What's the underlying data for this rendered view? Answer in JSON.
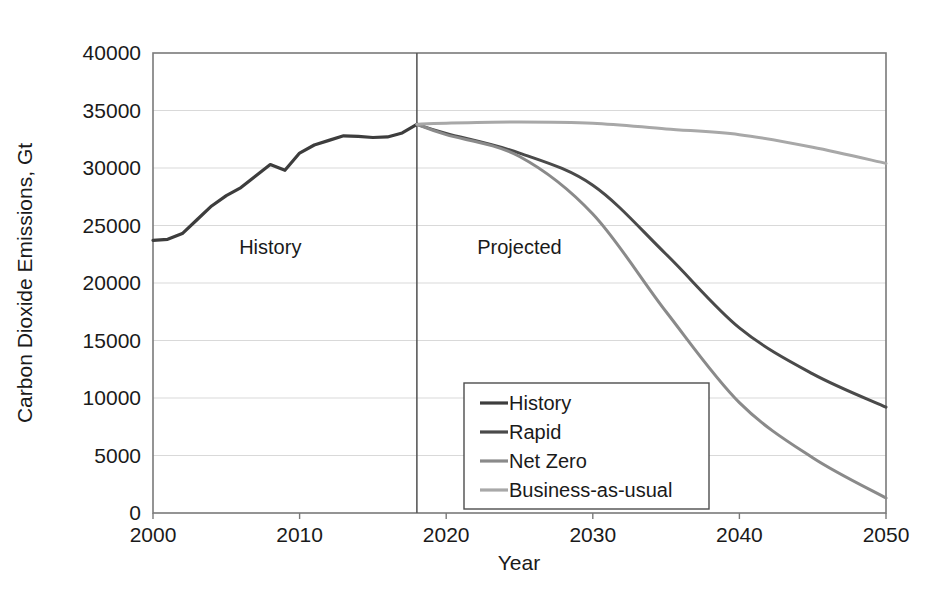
{
  "chart_data": {
    "type": "line",
    "title": "",
    "xlabel": "Year",
    "ylabel": "Carbon Dioxide Emissions, Gt",
    "xlim": [
      2000,
      2050
    ],
    "ylim": [
      0,
      40000
    ],
    "grid": true,
    "legend_position": "inside-bottom-center",
    "x_ticks": [
      "2000",
      "2010",
      "2020",
      "2030",
      "2040",
      "2050"
    ],
    "x_tick_values": [
      2000,
      2010,
      2020,
      2030,
      2040,
      2050
    ],
    "y_ticks": [
      "0",
      "5000",
      "10000",
      "15000",
      "20000",
      "25000",
      "30000",
      "35000",
      "40000"
    ],
    "y_tick_values": [
      0,
      5000,
      10000,
      15000,
      20000,
      25000,
      30000,
      35000,
      40000
    ],
    "annotations": [
      {
        "text": "History",
        "x": 2008,
        "y": 22500
      },
      {
        "text": "Projected",
        "x": 2025,
        "y": 22500
      }
    ],
    "divider": {
      "x": 2018,
      "label": "history-projection-divider"
    },
    "series": [
      {
        "name": "History",
        "color": "#3d3d3d",
        "width": 3.2,
        "x": [
          2000,
          2001,
          2002,
          2003,
          2004,
          2005,
          2006,
          2007,
          2008,
          2009,
          2010,
          2011,
          2012,
          2013,
          2014,
          2015,
          2016,
          2017,
          2018
        ],
        "values": [
          23700,
          23800,
          24300,
          25500,
          26700,
          27600,
          28300,
          29300,
          30300,
          29800,
          31300,
          32000,
          32400,
          32800,
          32750,
          32650,
          32700,
          33050,
          33800
        ]
      },
      {
        "name": "Rapid",
        "color": "#4a4a4a",
        "width": 3.0,
        "x": [
          2018,
          2020,
          2025,
          2030,
          2035,
          2040,
          2045,
          2050
        ],
        "values": [
          33800,
          33000,
          31300,
          28500,
          22500,
          16100,
          12100,
          9200
        ]
      },
      {
        "name": "Net Zero",
        "color": "#8a8a8a",
        "width": 3.0,
        "x": [
          2018,
          2020,
          2025,
          2030,
          2035,
          2040,
          2045,
          2050
        ],
        "values": [
          33800,
          32900,
          31000,
          26000,
          17500,
          9600,
          4800,
          1300
        ]
      },
      {
        "name": "Business-as-usual",
        "color": "#a8a8a8",
        "width": 3.0,
        "x": [
          2018,
          2020,
          2025,
          2030,
          2035,
          2040,
          2045,
          2050
        ],
        "values": [
          33800,
          33900,
          34000,
          33900,
          33400,
          32900,
          31800,
          30400
        ]
      }
    ],
    "legend_entries": [
      {
        "label": "History",
        "color": "#3d3d3d"
      },
      {
        "label": "Rapid",
        "color": "#4a4a4a"
      },
      {
        "label": "Net Zero",
        "color": "#8a8a8a"
      },
      {
        "label": "Business-as-usual",
        "color": "#a8a8a8"
      }
    ]
  },
  "colors": {
    "background": "#ffffff",
    "frame": "#7a7a7a",
    "grid": "#d9d9d9",
    "text": "#1a1a1a",
    "divider": "#5a5a5a"
  }
}
